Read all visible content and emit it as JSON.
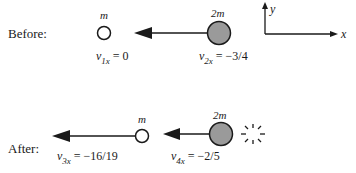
{
  "before": {
    "label": "Before:",
    "ball1": {
      "mass": "m",
      "velocity_var": "v",
      "velocity_sub": "1x",
      "velocity_value": "= 0"
    },
    "ball2": {
      "mass": "2m",
      "velocity_var": "v",
      "velocity_sub": "2x",
      "velocity_value": "= −3/4"
    }
  },
  "after": {
    "label": "After:",
    "ball3": {
      "mass": "m",
      "velocity_var": "v",
      "velocity_sub": "3x",
      "velocity_value": "= −16/19"
    },
    "ball4": {
      "mass": "2m",
      "velocity_var": "v",
      "velocity_sub": "4x",
      "velocity_value": "= −2/5"
    }
  },
  "axes": {
    "x_label": "x",
    "y_label": "y"
  },
  "colors": {
    "heavy_ball_fill": "#9a9a9a",
    "light_ball_fill": "#ffffff",
    "stroke": "#1a1a1a"
  }
}
